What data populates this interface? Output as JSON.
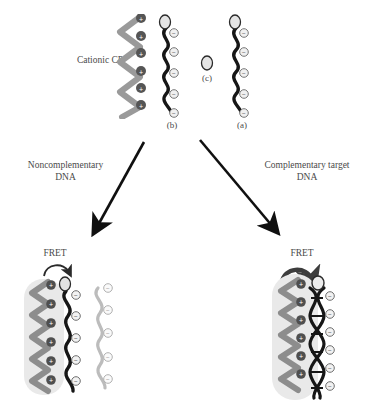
{
  "figure": {
    "background": "#ffffff"
  },
  "colors": {
    "cp_chain": "#8f8f8f",
    "cp_chain_dark": "#6f6f6f",
    "dna_black": "#141414",
    "dna_light": "#b9b9b9",
    "halo": "#e6e6e6",
    "charge_plus_fill": "#4a4a4a",
    "charge_minus_fill": "#f2f2f2",
    "text": "#4a4a4a",
    "arrow": "#101010"
  },
  "top_row": {
    "cp_label": "Cationic CP",
    "species": [
      {
        "key": "b",
        "label": "(b)",
        "description": "single-stranded DNA labelled with fluorophore, negatively charged",
        "charge_symbol": "⊖",
        "charge_count": 5,
        "has_fluorophore": true
      },
      {
        "key": "c",
        "label": "(c)",
        "description": "free fluorophore dye oval",
        "charge_symbol": "",
        "charge_count": 0,
        "has_fluorophore": true
      },
      {
        "key": "a",
        "label": "(a)",
        "description": "single-stranded DNA labelled with fluorophore, negatively charged",
        "charge_symbol": "⊖",
        "charge_count": 5,
        "has_fluorophore": true
      }
    ],
    "cp_charge_symbol": "⊕",
    "cp_charge_count": 6
  },
  "pathways": {
    "left": {
      "label_line1": "Noncomplementary",
      "label_line2": "DNA",
      "arrow": "down-left-arrow"
    },
    "right": {
      "label_line1": "Complementary target",
      "label_line2": "DNA",
      "arrow": "down-right-arrow"
    }
  },
  "bottom_left": {
    "fret_label": "FRET",
    "fret_arrow_style": "thin",
    "description": "Cationic CP complexed with fluorophore-labelled ssDNA; noncomplementary DNA remains separate",
    "cp_charge_symbol": "⊕",
    "cp_charge_count": 6,
    "dna_charge_symbol": "⊖",
    "dna_charge_count": 5,
    "free_dna_charge_symbol": "⊖",
    "free_dna_charge_count": 5
  },
  "bottom_right": {
    "fret_label": "FRET",
    "fret_arrow_style": "thick",
    "description": "Cationic CP complexed with DNA duplex formed from complementary target DNA",
    "cp_charge_symbol": "⊕",
    "cp_charge_count": 6,
    "dna_charge_symbol": "⊖",
    "dna_charge_count": 6
  }
}
